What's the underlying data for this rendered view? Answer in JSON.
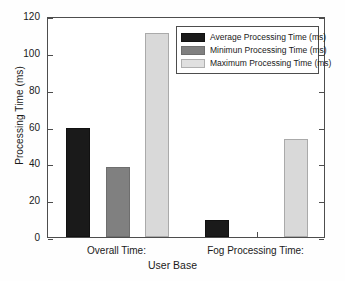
{
  "chart_data": {
    "type": "bar",
    "title": "",
    "subtitle": "",
    "xlabel": "User Base",
    "ylabel": "Processing Time (ms)",
    "categories": [
      "Overall Time:",
      "Fog Processing Time:"
    ],
    "series": [
      {
        "name": "Average Processing Time (ms)",
        "color": "#1a1a1a",
        "values": [
          59,
          9
        ]
      },
      {
        "name": "Minimun Processing Time (ms)",
        "color": "#808080",
        "values": [
          38,
          0
        ]
      },
      {
        "name": "Maximum Processing Time (ms)",
        "color": "#d9d9d9",
        "values": [
          111,
          53
        ]
      }
    ],
    "ylim": [
      0,
      120
    ],
    "yticks": [
      0,
      20,
      40,
      60,
      80,
      100,
      120
    ],
    "ytick_labels": [
      "0",
      "20",
      "40",
      "60",
      "80",
      "100",
      "120"
    ],
    "grid": false,
    "legend_position": "top-right",
    "frame": true,
    "background_color": "#ffffff",
    "axis_color": "#4d4d4d"
  },
  "legend": {
    "items": [
      {
        "label": "Average Processing Time (ms)",
        "swatch": "avg"
      },
      {
        "label": "Minimun Processing Time (ms)",
        "swatch": "min"
      },
      {
        "label": "Maximum Processing Time (ms)",
        "swatch": "max"
      }
    ]
  }
}
